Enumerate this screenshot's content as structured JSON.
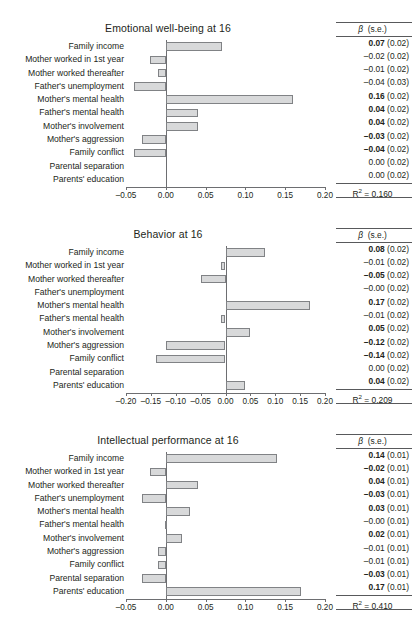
{
  "predictors": [
    "Family income",
    "Mother worked in 1st year",
    "Mother worked thereafter",
    "Father's unemployment",
    "Mother's mental health",
    "Father's mental health",
    "Mother's involvement",
    "Mother's aggression",
    "Family conflict",
    "Parental separation",
    "Parents' education"
  ],
  "stats_header": {
    "beta": "β",
    "se": "(s.e.)"
  },
  "r2_label": "R",
  "r2_sup": "2",
  "r2_eq": " = ",
  "colors": {
    "bar_fill": "#d8d9da",
    "bar_stroke": "#808285",
    "axis": "#6d6e71",
    "text": "#231f20"
  },
  "chart_data": [
    {
      "type": "bar",
      "title": "Emotional well-being at 16",
      "xlabel": "",
      "ylabel": "",
      "orientation": "horizontal",
      "xlim": [
        -0.05,
        0.2
      ],
      "xticks": [
        -0.05,
        0.0,
        0.05,
        0.1,
        0.15,
        0.2
      ],
      "xticklabels": [
        "–0.05",
        "0.00",
        "0.05",
        "0.10",
        "0.15",
        "0.20"
      ],
      "grid": false,
      "legend": "none",
      "categories": [
        "Family income",
        "Mother worked in 1st year",
        "Mother worked thereafter",
        "Father's unemployment",
        "Mother's mental health",
        "Father's mental health",
        "Mother's involvement",
        "Mother's aggression",
        "Family conflict",
        "Parental separation",
        "Parents' education"
      ],
      "values": [
        0.07,
        -0.02,
        -0.01,
        -0.04,
        0.16,
        0.04,
        0.04,
        -0.03,
        -0.04,
        0.0,
        0.0
      ],
      "beta_labels": [
        "0.07",
        "–0.02",
        "–0.01",
        "–0.04",
        "0.16",
        "0.04",
        "0.04",
        "–0.03",
        "–0.04",
        "0.00",
        "0.00"
      ],
      "se_labels": [
        "(0.02)",
        "(0.02)",
        "(0.02)",
        "(0.03)",
        "(0.02)",
        "(0.02)",
        "(0.02)",
        "(0.02)",
        "(0.02)",
        "(0.02)",
        "(0.02)"
      ],
      "bold": [
        true,
        false,
        false,
        false,
        true,
        true,
        true,
        true,
        true,
        false,
        false
      ],
      "r2": "0.160"
    },
    {
      "type": "bar",
      "title": "Behavior at 16",
      "xlabel": "",
      "ylabel": "",
      "orientation": "horizontal",
      "xlim": [
        -0.2,
        0.2
      ],
      "xticks": [
        -0.2,
        -0.15,
        -0.1,
        -0.05,
        0.0,
        0.05,
        0.1,
        0.15,
        0.2
      ],
      "xticklabels": [
        "–0.20",
        "–0.15",
        "–0.10",
        "–0.05",
        "0.00",
        "0.05",
        "0.10",
        "0.15",
        "0.20"
      ],
      "grid": false,
      "legend": "none",
      "categories": [
        "Family income",
        "Mother worked in 1st year",
        "Mother worked thereafter",
        "Father's unemployment",
        "Mother's mental health",
        "Father's mental health",
        "Mother's involvement",
        "Mother's aggression",
        "Family conflict",
        "Parental separation",
        "Parents' education"
      ],
      "values": [
        0.08,
        -0.01,
        -0.05,
        -0.001,
        0.17,
        -0.01,
        0.05,
        -0.12,
        -0.14,
        0.0,
        0.04
      ],
      "beta_labels": [
        "0.08",
        "–0.01",
        "–0.05",
        "–0.00",
        "0.17",
        "–0.01",
        "0.05",
        "–0.12",
        "–0.14",
        "0.00",
        "0.04"
      ],
      "se_labels": [
        "(0.02)",
        "(0.02)",
        "(0.02)",
        "(0.02)",
        "(0.02)",
        "(0.02)",
        "(0.02)",
        "(0.02)",
        "(0.02)",
        "(0.02)",
        "(0.02)"
      ],
      "bold": [
        true,
        false,
        true,
        false,
        true,
        false,
        true,
        true,
        true,
        false,
        true
      ],
      "r2": "0.209"
    },
    {
      "type": "bar",
      "title": "Intellectual performance at 16",
      "xlabel": "",
      "ylabel": "",
      "orientation": "horizontal",
      "xlim": [
        -0.05,
        0.2
      ],
      "xticks": [
        -0.05,
        0.0,
        0.05,
        0.1,
        0.15,
        0.2
      ],
      "xticklabels": [
        "–0.05",
        "0.00",
        "0.05",
        "0.10",
        "0.15",
        "0.20"
      ],
      "grid": false,
      "legend": "none",
      "categories": [
        "Family income",
        "Mother worked in 1st year",
        "Mother worked thereafter",
        "Father's unemployment",
        "Mother's mental health",
        "Father's mental health",
        "Mother's involvement",
        "Mother's aggression",
        "Family conflict",
        "Parental separation",
        "Parents' education"
      ],
      "values": [
        0.14,
        -0.02,
        0.04,
        -0.03,
        0.03,
        -0.001,
        0.02,
        -0.01,
        -0.01,
        -0.03,
        0.17
      ],
      "beta_labels": [
        "0.14",
        "–0.02",
        "0.04",
        "–0.03",
        "0.03",
        "–0.00",
        "0.02",
        "–0.01",
        "–0.01",
        "–0.03",
        "0.17"
      ],
      "se_labels": [
        "(0.01)",
        "(0.01)",
        "(0.01)",
        "(0.01)",
        "(0.01)",
        "(0.01)",
        "(0.01)",
        "(0.01)",
        "(0.01)",
        "(0.01)",
        "(0.01)"
      ],
      "bold": [
        true,
        true,
        true,
        true,
        true,
        false,
        true,
        false,
        false,
        true,
        true
      ],
      "r2": "0.410"
    }
  ]
}
